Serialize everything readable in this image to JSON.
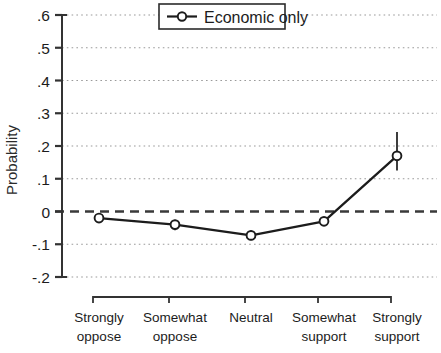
{
  "chart_data": {
    "type": "line",
    "title": "",
    "subtitle": "",
    "xlabel": "",
    "ylabel": "Probability",
    "categories": [
      "Strongly oppose",
      "Somewhat oppose",
      "Neutral",
      "Somewhat support",
      "Strongly support"
    ],
    "category_lines": [
      [
        "Strongly",
        "oppose"
      ],
      [
        "Somewhat",
        "oppose"
      ],
      [
        "Neutral",
        ""
      ],
      [
        "Somewhat",
        "support"
      ],
      [
        "Strongly",
        "support"
      ]
    ],
    "series": [
      {
        "name": "Economic only",
        "values": [
          -0.02,
          -0.04,
          -0.073,
          -0.03,
          0.17
        ],
        "error_low": [
          -0.032,
          -0.057,
          -0.088,
          -0.043,
          0.125
        ],
        "error_high": [
          -0.01,
          -0.025,
          -0.058,
          -0.018,
          0.243
        ],
        "marker": "open-circle",
        "color": "#1c1c1c"
      }
    ],
    "ylim": [
      -0.2,
      0.6
    ],
    "ytick_values": [
      0.6,
      0.5,
      0.4,
      0.3,
      0.2,
      0.1,
      0,
      -0.1,
      -0.2
    ],
    "ytick_labels": [
      ".6",
      ".5",
      ".4",
      ".3",
      ".2",
      ".1",
      "0",
      "-.1",
      "-.2"
    ],
    "grid": true,
    "grid_style": "dotted",
    "reference_line": {
      "value": 0,
      "style": "dashed"
    },
    "legend": {
      "position": "top-center-right",
      "entries": [
        {
          "label": "Economic only",
          "marker": "open-circle"
        }
      ]
    },
    "axis_style": "bracket"
  },
  "colors": {
    "line": "#1c1c1c",
    "grid": "#9a9a9a",
    "axis": "#333333",
    "background": "#ffffff",
    "text": "#1c1c1c"
  }
}
